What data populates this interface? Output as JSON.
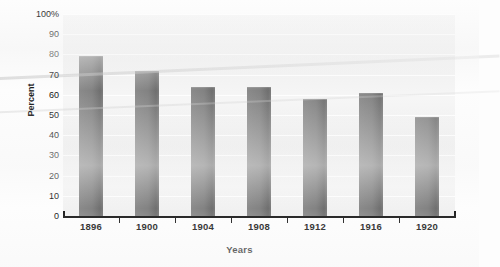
{
  "chart_data": {
    "type": "bar",
    "title": "",
    "xlabel": "Years",
    "ylabel": "Percent",
    "categories": [
      "1896",
      "1900",
      "1904",
      "1908",
      "1912",
      "1916",
      "1920"
    ],
    "values": [
      79,
      72,
      64,
      64,
      58,
      61,
      49
    ],
    "ylim": [
      0,
      100
    ],
    "ytick_values": [
      0,
      10,
      20,
      30,
      40,
      50,
      60,
      70,
      80,
      90,
      100
    ],
    "ytick_labels": [
      "0",
      "10",
      "20",
      "30",
      "40",
      "50",
      "60",
      "70",
      "80",
      "90",
      "100%"
    ],
    "grid": true,
    "legend": false,
    "legend_position": "none",
    "bar_color": "#808080",
    "plot_background": "#f2f2f2",
    "axis_color": "#1a1a1a",
    "text_color": "#111111"
  }
}
